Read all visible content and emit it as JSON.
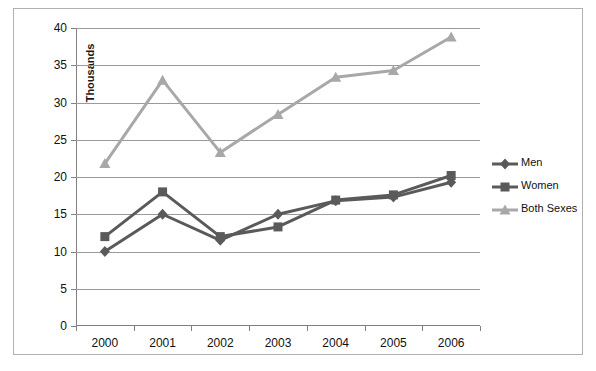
{
  "chart_data": {
    "type": "line",
    "title": "",
    "xlabel": "",
    "ylabel": "Thousands",
    "categories": [
      "2000",
      "2001",
      "2002",
      "2003",
      "2004",
      "2005",
      "2006"
    ],
    "ylim": [
      0,
      40
    ],
    "ytick_step": 5,
    "yticks": [
      "40",
      "35",
      "30",
      "25",
      "20",
      "15",
      "10",
      "5",
      "0"
    ],
    "grid": true,
    "legend_position": "right",
    "series": [
      {
        "name": "Men",
        "marker": "diamond",
        "color": "#5a5a5a",
        "values": [
          10.0,
          15.0,
          11.5,
          15.0,
          16.8,
          17.3,
          19.3
        ]
      },
      {
        "name": "Women",
        "marker": "square",
        "color": "#5a5a5a",
        "values": [
          12.0,
          18.0,
          12.0,
          13.3,
          16.9,
          17.6,
          20.2
        ]
      },
      {
        "name": "Both Sexes",
        "marker": "triangle",
        "color": "#a8a8a8",
        "values": [
          21.8,
          33.0,
          23.3,
          28.4,
          33.4,
          34.3,
          38.8
        ]
      }
    ]
  },
  "legend": {
    "items": [
      {
        "label": "Men"
      },
      {
        "label": "Women"
      },
      {
        "label": "Both Sexes"
      }
    ]
  },
  "colors": {
    "series_dark": "#5a5a5a",
    "series_light": "#a8a8a8",
    "gridline": "#9a9a9a",
    "axis": "#808080",
    "border": "#b0b0b0"
  }
}
